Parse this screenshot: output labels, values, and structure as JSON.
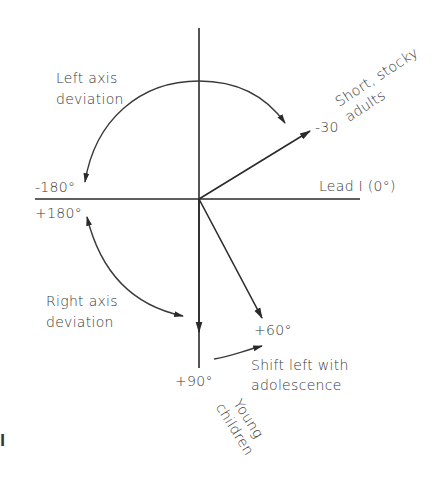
{
  "diagram": {
    "type": "hexaxial-cardiac-axis",
    "labels": {
      "left_axis_line1": "Left axis",
      "left_axis_line2": "deviation",
      "minus180": "-180°",
      "plus180": "+180°",
      "right_axis_line1": "Right axis",
      "right_axis_line2": "deviation",
      "lead1": "Lead I (0°)",
      "minus30": "-30",
      "short_stocky_line1": "Short, stocky",
      "short_stocky_line2": "adults",
      "plus60": "+60°",
      "shift_left_line1": "Shift left with",
      "shift_left_line2": "adolescence",
      "plus90": "+90°",
      "young_line1": "Young",
      "young_line2": "children",
      "stray_mark": "l"
    },
    "vectors": [
      {
        "name": "lead-I",
        "angle_deg": 0
      },
      {
        "name": "minus-30",
        "angle_deg": -30
      },
      {
        "name": "plus-60",
        "angle_deg": 60
      },
      {
        "name": "plus-90",
        "angle_deg": 90
      }
    ],
    "colors": {
      "ink": "#2a2a2a",
      "text": "#3a3a3a",
      "background": "#ffffff"
    }
  }
}
